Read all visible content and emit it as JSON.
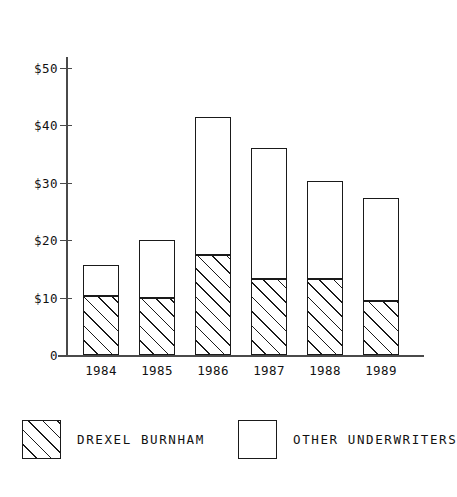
{
  "chart_data": {
    "type": "bar",
    "subtype": "stacked-vertical",
    "title": "",
    "subtitle": "",
    "xlabel": "",
    "ylabel": "",
    "categories": [
      "1984",
      "1985",
      "1986",
      "1987",
      "1988",
      "1989"
    ],
    "series": [
      {
        "name": "DREXEL BURNHAM",
        "values": [
          10.2,
          10.0,
          17.5,
          13.3,
          13.2,
          9.4
        ],
        "fill": "diagonal-hatch",
        "color": "#ffffff",
        "stroke": "#1a1a1a"
      },
      {
        "name": "OTHER UNDERWRITERS",
        "values": [
          5.5,
          10.0,
          24.0,
          22.7,
          17.2,
          17.9
        ],
        "fill": "solid-white",
        "color": "#ffffff",
        "stroke": "#1a1a1a"
      }
    ],
    "totals": [
      15.7,
      20.0,
      41.5,
      36.0,
      30.4,
      27.3
    ],
    "ylim": [
      0,
      50
    ],
    "ytick_values": [
      0,
      10,
      20,
      30,
      40,
      50
    ],
    "ytick_labels": [
      "0",
      "$10",
      "$20",
      "$30",
      "$40",
      "$50"
    ],
    "grid": false,
    "legend_position": "bottom",
    "axis_color": "#4a4a4a",
    "line_color": "#1a1a1a",
    "background": "#ffffff"
  },
  "axes": {
    "y_ticks": [
      {
        "label": "$50",
        "value": 50
      },
      {
        "label": "$40",
        "value": 40
      },
      {
        "label": "$30",
        "value": 30
      },
      {
        "label": "$20",
        "value": 20
      },
      {
        "label": "$10",
        "value": 10
      },
      {
        "label": "0",
        "value": 0
      }
    ],
    "x_ticks": [
      {
        "label": "1984"
      },
      {
        "label": "1985"
      },
      {
        "label": "1986"
      },
      {
        "label": "1987"
      },
      {
        "label": "1988"
      },
      {
        "label": "1989"
      }
    ]
  },
  "legend": {
    "items": [
      {
        "label": "DREXEL BURNHAM",
        "swatch": "hatched"
      },
      {
        "label": "OTHER UNDERWRITERS",
        "swatch": "plain"
      }
    ]
  }
}
